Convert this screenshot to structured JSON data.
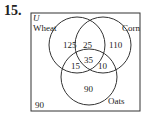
{
  "problem_number": "15.",
  "universe_label": "U",
  "sets": [
    {
      "name": "Wheat"
    },
    {
      "name": "Corn"
    },
    {
      "name": "Oats"
    }
  ],
  "regions": {
    "wheat_only": "125",
    "wheat_corn": "25",
    "corn_only": "110",
    "wheat_oats": "15",
    "all_three": "35",
    "corn_oats": "10",
    "oats_only": "90",
    "none": "90"
  }
}
